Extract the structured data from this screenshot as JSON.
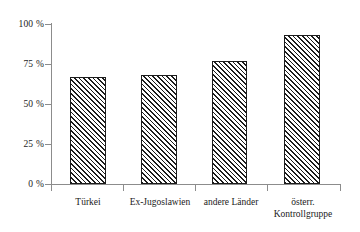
{
  "chart_data": {
    "type": "bar",
    "title": "",
    "subtitle": "",
    "xlabel": "",
    "ylabel": "",
    "categories": [
      "Türkei",
      "Ex-Jugoslawien",
      "andere Länder",
      "österr. Kontrollgruppe"
    ],
    "category_lines": [
      [
        "Türkei"
      ],
      [
        "Ex-Jugoslawien"
      ],
      [
        "andere Länder"
      ],
      [
        "österr.",
        "Kontrollgruppe"
      ]
    ],
    "values": [
      67,
      68,
      77,
      93
    ],
    "ylim": [
      0,
      100
    ],
    "yticks": [
      0,
      25,
      50,
      75,
      100
    ],
    "ytick_labels": [
      "0 %",
      "25 %",
      "50 %",
      "75 %",
      "100 %"
    ],
    "grid": false,
    "legend": null,
    "legend_position": "none",
    "bar_fill": "diagonal-hatch",
    "bar_border_color": "#1c1c1c",
    "axis_color": "#8c8c8c",
    "background_color": "#ffffff",
    "text_color": "#1a1a1a"
  },
  "axis": {
    "y_labels": [
      {
        "text": "100 %",
        "value": 100
      },
      {
        "text": "75 %",
        "value": 75
      },
      {
        "text": "50 %",
        "value": 50
      },
      {
        "text": "25 %",
        "value": 25
      },
      {
        "text": "0 %",
        "value": 0
      }
    ]
  }
}
